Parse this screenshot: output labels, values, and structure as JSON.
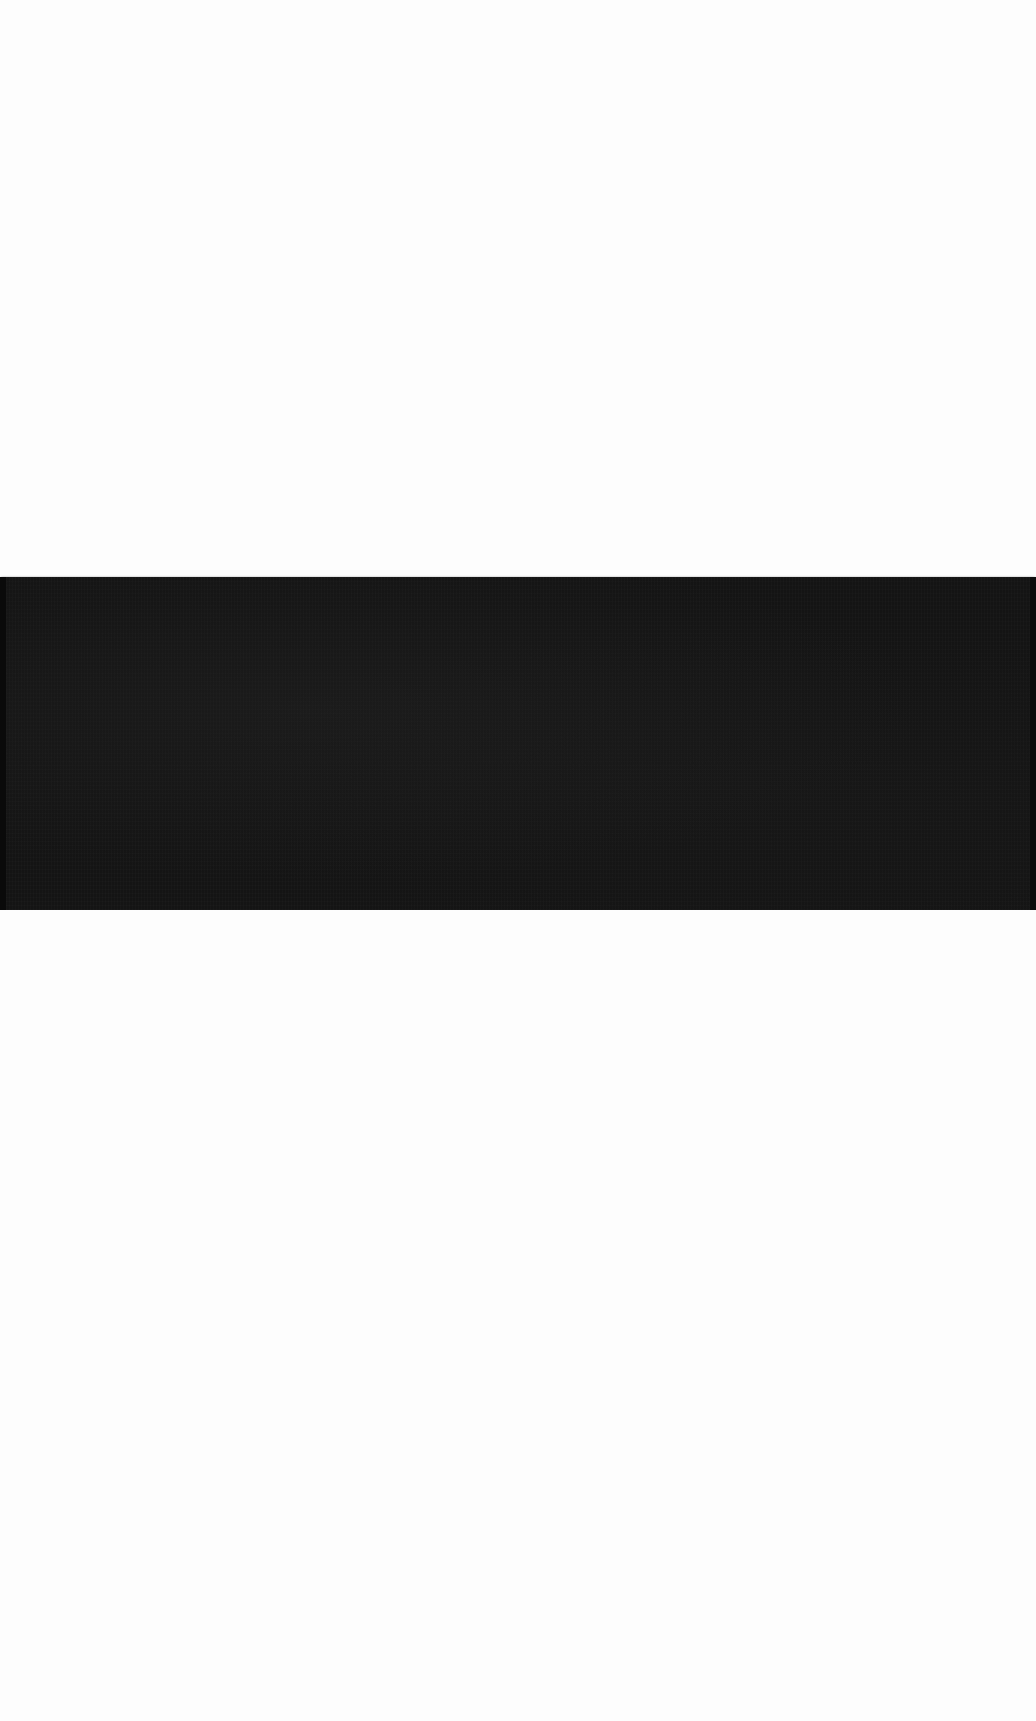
{
  "scene": {
    "description": "White page with a single dark horizontal band across the full width",
    "background_color": "#fdfdfd",
    "band": {
      "color": "#141414",
      "top_px": 577,
      "height_px": 333,
      "width_px": 1036
    }
  }
}
